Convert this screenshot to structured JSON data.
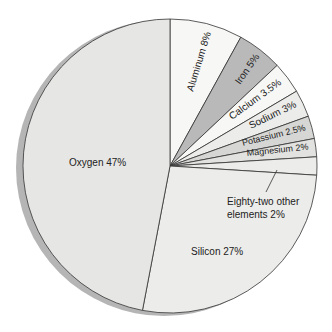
{
  "chart_data": {
    "type": "pie",
    "title": "",
    "start_angle_deg": 0,
    "direction": "clockwise",
    "slices": [
      {
        "name": "Aluminum",
        "value": 8,
        "label": "Aluminum 8%",
        "color": "#f7f7f5"
      },
      {
        "name": "Iron",
        "value": 5,
        "label": "Iron 5%",
        "color": "#b9b9b9"
      },
      {
        "name": "Calcium",
        "value": 3.5,
        "label": "Calcium 3.5%",
        "color": "#f7f7f5"
      },
      {
        "name": "Sodium",
        "value": 3,
        "label": "Sodium 3%",
        "color": "#ececea"
      },
      {
        "name": "Potassium",
        "value": 2.5,
        "label": "Potassium 2.5%",
        "color": "#d6d6d4"
      },
      {
        "name": "Magnesium",
        "value": 2,
        "label": "Magnesium 2%",
        "color": "#e2e2e0"
      },
      {
        "name": "Eighty-two other elements",
        "value": 2,
        "label": "Eighty-two other elements 2%",
        "color": "#ececea"
      },
      {
        "name": "Silicon",
        "value": 27,
        "label": "Silicon 27%",
        "color": "#ececea"
      },
      {
        "name": "Oxygen",
        "value": 47,
        "label": "Oxygen 47%",
        "color": "#e6e6e4"
      }
    ],
    "categories": [
      "Aluminum",
      "Iron",
      "Calcium",
      "Sodium",
      "Potassium",
      "Magnesium",
      "Eighty-two other elements",
      "Silicon",
      "Oxygen"
    ],
    "values": [
      8,
      5,
      3.5,
      3,
      2.5,
      2,
      2,
      27,
      47
    ],
    "legend": "none (labels on slices)"
  },
  "labels": {
    "aluminum": "Aluminum 8%",
    "iron": "Iron 5%",
    "calcium": "Calcium 3.5%",
    "sodium": "Sodium 3%",
    "potassium": "Potassium 2.5%",
    "magnesium": "Magnesium 2%",
    "other_line1": "Eighty-two other",
    "other_line2": "elements 2%",
    "silicon": "Silicon 27%",
    "oxygen": "Oxygen 47%"
  }
}
